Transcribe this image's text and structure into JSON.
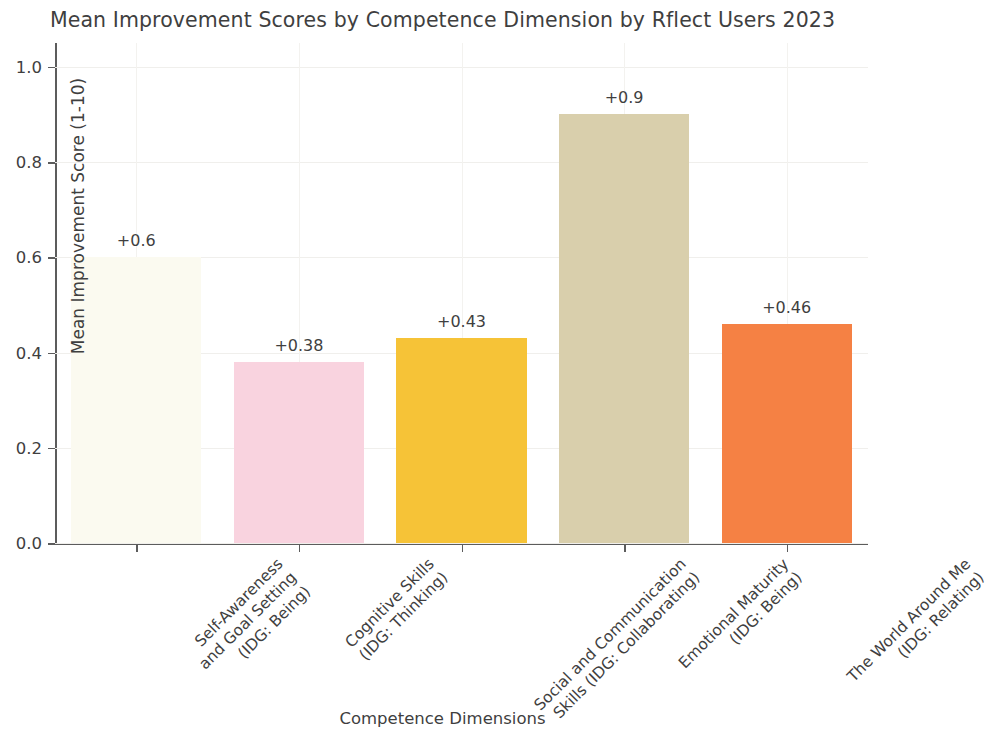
{
  "chart_data": {
    "type": "bar",
    "title": "Mean Improvement Scores by Competence Dimension by Rflect Users 2023",
    "xlabel": "Competence Dimensions",
    "ylabel": "Mean Improvement Score (1-10)",
    "ylim": [
      0.0,
      1.05
    ],
    "grid": true,
    "legend": null,
    "categories": [
      "Self-Awareness and Goal Setting (IDG: Being)",
      "Cognitive Skills (IDG: Thinking)",
      "Social and Communication Skills (IDG: Collaborating)",
      "Emotional Maturity (IDG: Being)",
      "The World Around Me (IDG: Relating)"
    ],
    "category_lines": [
      [
        "Self-Awareness",
        "and Goal Setting",
        "(IDG: Being)"
      ],
      [
        "Cognitive Skills",
        "(IDG: Thinking)"
      ],
      [
        "Social and Communication",
        "Skills (IDG: Collaborating)"
      ],
      [
        "Emotional Maturity",
        "(IDG: Being)"
      ],
      [
        "The World Around Me",
        "(IDG: Relating)"
      ]
    ],
    "values": [
      0.6,
      0.38,
      0.43,
      0.9,
      0.46
    ],
    "value_labels": [
      "+0.6",
      "+0.38",
      "+0.43",
      "+0.9",
      "+0.46"
    ],
    "bar_colors": [
      "#FBFAF0",
      "#F9D3DF",
      "#F6C337",
      "#D9CFAC",
      "#F58144"
    ],
    "ytick_labels": [
      "0.0",
      "0.2",
      "0.4",
      "0.6",
      "0.8",
      "1.0"
    ],
    "ytick_values": [
      0.0,
      0.2,
      0.4,
      0.6,
      0.8,
      1.0
    ]
  }
}
